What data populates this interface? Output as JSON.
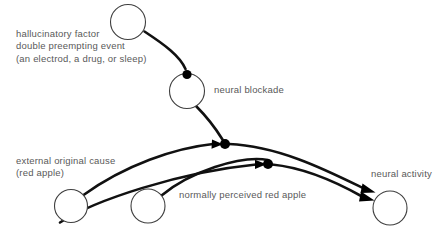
{
  "diagram": {
    "background_color": "#ffffff",
    "text_color": "#595959",
    "arrow_color": "#111111",
    "node_stroke_color": "#3f3f3f",
    "labels": {
      "hallucinatory_factor": "hallucinatory factor\ndouble preempting event\n(an electrod, a drug, or sleep)",
      "neural_blockade": "neural blockade",
      "external_original_cause": "external original cause\n(red apple)",
      "normally_perceived_red_apple": "normally perceived red apple",
      "neural_activity": "neural activity"
    },
    "nodes": [
      {
        "name": "hallucinatory-factor-node",
        "cx": 128,
        "cy": 22,
        "r": 17.5
      },
      {
        "name": "neural-blockade-node",
        "cx": 187,
        "cy": 91,
        "r": 17.5
      },
      {
        "name": "external-original-cause-node",
        "cx": 71,
        "cy": 206,
        "r": 16.5
      },
      {
        "name": "normally-perceived-node",
        "cx": 148,
        "cy": 206,
        "r": 17
      },
      {
        "name": "neural-activity-node",
        "cx": 390,
        "cy": 208,
        "r": 17
      }
    ],
    "junctions": [
      {
        "name": "blockade-top-junction",
        "cx": 187,
        "cy": 74,
        "r": 4.6
      },
      {
        "name": "upper-junction",
        "cx": 225,
        "cy": 144,
        "r": 5.0
      },
      {
        "name": "lower-junction",
        "cx": 268,
        "cy": 164,
        "r": 5.0
      }
    ],
    "edges": [
      {
        "name": "edge-hallucinatory-to-blockade",
        "from": "hallucinatory-factor-node",
        "to": "blockade-top-junction",
        "arrowhead": false
      },
      {
        "name": "edge-blockade-to-upper-junction",
        "from": "neural-blockade-node",
        "to": "upper-junction",
        "arrowhead": false
      },
      {
        "name": "edge-external-cause-to-upper-junction",
        "from": "external-original-cause-node",
        "to": "upper-junction",
        "arrowhead": true
      },
      {
        "name": "edge-external-cause-to-lower-junction",
        "from": "external-original-cause-node",
        "to": "lower-junction",
        "arrowhead": true
      },
      {
        "name": "edge-upper-junction-to-neural-activity",
        "from": "upper-junction",
        "to": "neural-activity-node",
        "arrowhead": true
      },
      {
        "name": "edge-lower-junction-to-neural-activity",
        "from": "lower-junction",
        "to": "neural-activity-node",
        "arrowhead": true
      },
      {
        "name": "edge-normally-perceived-to-neural-activity",
        "from": "normally-perceived-node",
        "to": "neural-activity-node",
        "arrowhead": true
      }
    ]
  }
}
